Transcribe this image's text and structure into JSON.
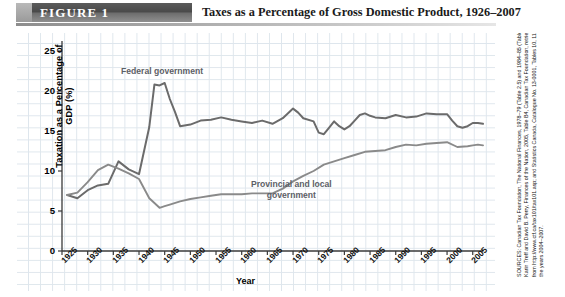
{
  "header": {
    "figure_label": "FIGURE 1",
    "title": "Taxes as a Percentage of Gross Domestic Product, 1926–2007"
  },
  "sources": {
    "text": "SOURCES: Canadian Tax Foundation, The National Finances, 1978–79 (Table 2.5) and 1984–85 (Table 3.5); Karin Treff and David B. Perry, Finances of the Nation, 2005, Table B4, Canadian Tax Foundation, retrieved from http://www.ctf.ca/tax101/tax101.asp; and Statistics Canada, Catalogue No. 13-0001, Tables 10, 11, 12 for the years 2004–2007."
  },
  "chart_data": {
    "type": "line",
    "title": "Taxes as a Percentage of Gross Domestic Product, 1926–2007",
    "xlabel": "Year",
    "ylabel": "Taxation as a Percentage of GDP (%)",
    "xlim": [
      1925,
      2007
    ],
    "ylim": [
      0,
      26
    ],
    "yticks": [
      0,
      5,
      10,
      15,
      20,
      25
    ],
    "xticks": [
      1925,
      1930,
      1935,
      1940,
      1945,
      1950,
      1955,
      1960,
      1965,
      1970,
      1975,
      1980,
      1985,
      1990,
      1995,
      2000,
      2005
    ],
    "grid": true,
    "legend": "inline-annotations",
    "series": [
      {
        "name": "Federal government",
        "color": "#6b6b6b",
        "x": [
          1926,
          1928,
          1930,
          1932,
          1934,
          1936,
          1938,
          1940,
          1942,
          1943,
          1944,
          1945,
          1946,
          1947,
          1948,
          1950,
          1952,
          1954,
          1956,
          1958,
          1960,
          1962,
          1964,
          1966,
          1968,
          1970,
          1971,
          1972,
          1974,
          1975,
          1976,
          1977,
          1978,
          1979,
          1980,
          1981,
          1982,
          1983,
          1984,
          1985,
          1986,
          1988,
          1990,
          1992,
          1994,
          1996,
          1998,
          2000,
          2001,
          2002,
          2003,
          2004,
          2005,
          2006,
          2007
        ],
        "values": [
          7.0,
          6.6,
          7.6,
          8.2,
          8.4,
          11.2,
          10.2,
          9.6,
          15.5,
          20.8,
          20.7,
          21.0,
          19.0,
          17.4,
          15.6,
          15.8,
          16.3,
          16.4,
          16.7,
          16.4,
          16.2,
          16.0,
          16.3,
          15.9,
          16.6,
          17.8,
          17.3,
          16.6,
          16.2,
          14.8,
          14.6,
          15.4,
          16.2,
          15.6,
          15.2,
          15.6,
          16.3,
          17.0,
          17.2,
          16.9,
          16.7,
          16.6,
          17.0,
          16.7,
          16.8,
          17.2,
          17.1,
          17.1,
          16.3,
          15.6,
          15.4,
          15.6,
          16.0,
          16.0,
          15.9
        ]
      },
      {
        "name": "Provincial and local government",
        "color": "#8a8a8a",
        "x": [
          1926,
          1928,
          1930,
          1932,
          1934,
          1936,
          1938,
          1940,
          1942,
          1944,
          1945,
          1946,
          1948,
          1950,
          1952,
          1954,
          1956,
          1958,
          1960,
          1962,
          1964,
          1966,
          1968,
          1970,
          1972,
          1974,
          1976,
          1978,
          1980,
          1982,
          1984,
          1986,
          1988,
          1990,
          1992,
          1994,
          1996,
          1998,
          2000,
          2002,
          2004,
          2005,
          2006,
          2007
        ],
        "values": [
          7.0,
          7.3,
          8.6,
          10.1,
          10.8,
          10.3,
          9.7,
          9.0,
          6.6,
          5.4,
          5.6,
          5.8,
          6.2,
          6.5,
          6.7,
          6.9,
          7.1,
          7.1,
          7.1,
          7.2,
          7.2,
          7.2,
          7.8,
          8.7,
          9.4,
          10.0,
          10.8,
          11.2,
          11.6,
          12.0,
          12.4,
          12.5,
          12.6,
          13.0,
          13.3,
          13.2,
          13.4,
          13.5,
          13.6,
          13.0,
          13.1,
          13.2,
          13.3,
          13.2
        ]
      }
    ]
  }
}
